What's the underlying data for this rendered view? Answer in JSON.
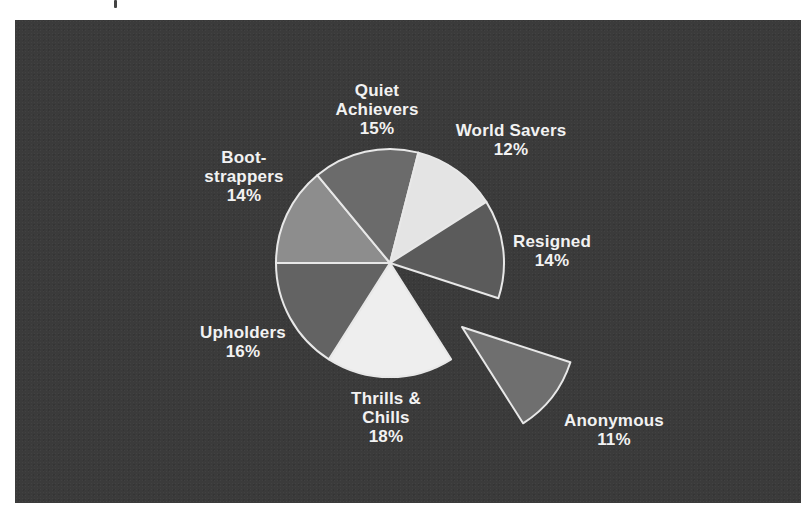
{
  "chart_data": {
    "type": "pie",
    "title": "",
    "start_angle_deg": 180,
    "direction": "clockwise",
    "exploded": [
      "Anonymous"
    ],
    "slices": [
      {
        "label": "Boot-\nstrappers",
        "name": "Bootstrappers",
        "value": 14,
        "display": "14%",
        "color": "#8d8d8d",
        "label_pos": [
          244,
          148
        ]
      },
      {
        "label": "Quiet\nAchievers",
        "name": "Quiet Achievers",
        "value": 15,
        "display": "15%",
        "color": "#6b6b6b",
        "label_pos": [
          377,
          81
        ]
      },
      {
        "label": "World Savers",
        "name": "World Savers",
        "value": 12,
        "display": "12%",
        "color": "#e4e4e4",
        "label_pos": [
          511,
          121
        ]
      },
      {
        "label": "Resigned",
        "name": "Resigned",
        "value": 14,
        "display": "14%",
        "color": "#5b5b5b",
        "label_pos": [
          552,
          232
        ]
      },
      {
        "label": "Anonymous",
        "name": "Anonymous",
        "value": 11,
        "display": "11%",
        "color": "#6f6f6f",
        "label_pos": [
          614,
          411
        ]
      },
      {
        "label": "Thrills &\nChills",
        "name": "Thrills & Chills",
        "value": 18,
        "display": "18%",
        "color": "#eeeeee",
        "label_pos": [
          386,
          389
        ]
      },
      {
        "label": "Upholders",
        "name": "Upholders",
        "value": 16,
        "display": "16%",
        "color": "#636363",
        "label_pos": [
          243,
          323
        ]
      }
    ],
    "center": [
      390,
      263
    ],
    "radius": 114,
    "explode_offset": [
      72,
      64
    ],
    "legend": "none (direct labels)"
  },
  "colors": {
    "panel_background": "#3b3b3b",
    "label_text": "#f2f2f2",
    "slice_outline": "#e8e8e8"
  }
}
